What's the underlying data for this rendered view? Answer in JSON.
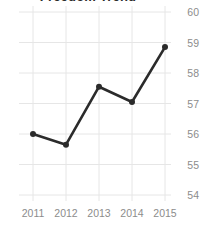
{
  "chart_data": {
    "type": "line",
    "title": "Freedom Trend",
    "title_clipped": true,
    "xlabel": "",
    "ylabel": "",
    "categories": [
      "2011",
      "2012",
      "2013",
      "2014",
      "2015"
    ],
    "x": [
      2011,
      2012,
      2013,
      2014,
      2015
    ],
    "values": [
      56.0,
      55.65,
      57.55,
      57.05,
      58.85
    ],
    "series": [
      {
        "name": "Freedom Trend",
        "values": [
          56.0,
          55.65,
          57.55,
          57.05,
          58.85
        ]
      }
    ],
    "ylim": [
      54,
      60
    ],
    "yticks": [
      54,
      55,
      56,
      57,
      58,
      59,
      60
    ],
    "ytick_labels": [
      "54",
      "55",
      "56",
      "57",
      "58",
      "59",
      "60"
    ],
    "xticks": [
      2011,
      2012,
      2013,
      2014,
      2015
    ],
    "xtick_labels": [
      "2011",
      "2012",
      "2013",
      "2014",
      "2015"
    ],
    "grid": true,
    "grid_axis": "both",
    "legend": false,
    "legend_position": "none",
    "y_axis_side": "right",
    "markers": true,
    "marker_style": "circle"
  },
  "style": {
    "line_color": "#2b2b2b",
    "marker_color": "#2b2b2b",
    "grid_color": "#e6e6e6",
    "tick_label_color": "#8c8c8c",
    "title_color": "#2b2b2b",
    "background": "#ffffff",
    "line_width": 2.6,
    "marker_radius": 3.0
  },
  "geometry": {
    "plot_left": 33,
    "plot_right": 165,
    "plot_top": 12,
    "plot_bottom": 195
  }
}
